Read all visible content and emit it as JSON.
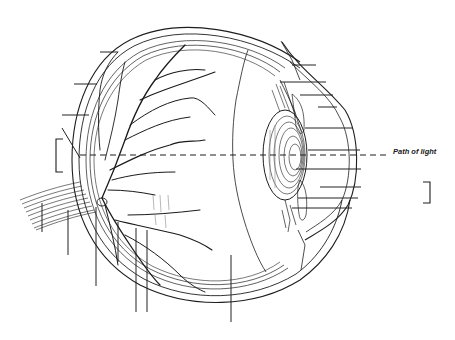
{
  "figure": {
    "annotation": {
      "path_of_light": "Path of light"
    },
    "colors": {
      "ink": "#1e1e1e",
      "background": "#ffffff"
    },
    "blank_label_leaders": {
      "left_side": [
        {
          "id": "L1",
          "y": 52
        },
        {
          "id": "L2",
          "y": 84
        },
        {
          "id": "L3",
          "y": 115
        }
      ],
      "right_side": [
        {
          "id": "R1",
          "y": 65
        },
        {
          "id": "R2",
          "y": 82
        },
        {
          "id": "R3",
          "y": 95
        },
        {
          "id": "R4",
          "y": 107
        },
        {
          "id": "R5",
          "y": 128
        },
        {
          "id": "R6",
          "y": 150
        },
        {
          "id": "R7",
          "y": 169
        },
        {
          "id": "R8",
          "y": 187
        },
        {
          "id": "R9",
          "y": 198
        },
        {
          "id": "R10",
          "y": 208
        }
      ],
      "bottom": [
        {
          "id": "B1",
          "x": 42
        },
        {
          "id": "B2",
          "x": 68
        },
        {
          "id": "B3",
          "x": 96
        },
        {
          "id": "B4",
          "x": 118
        },
        {
          "id": "B5",
          "x": 136
        },
        {
          "id": "B6",
          "x": 147
        },
        {
          "id": "B7",
          "x": 231
        }
      ]
    },
    "brackets": [
      {
        "id": "left-bracket",
        "side": "left",
        "y_range": [
          139,
          172
        ]
      },
      {
        "id": "right-bracket",
        "side": "right",
        "y_range": [
          182,
          203
        ]
      }
    ]
  }
}
